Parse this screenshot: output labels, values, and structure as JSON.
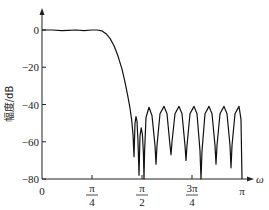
{
  "chart_data": {
    "type": "line",
    "title": "",
    "xlabel": "ω",
    "ylabel": "幅度/dB",
    "xlim": [
      0,
      3.14159
    ],
    "ylim": [
      -80,
      0
    ],
    "grid": false,
    "legend": null,
    "x_ticks": [
      {
        "value": 0,
        "label": "0"
      },
      {
        "value": 0.7854,
        "label_num": "π",
        "label_den": "4"
      },
      {
        "value": 1.5708,
        "label_num": "π",
        "label_den": "2"
      },
      {
        "value": 2.3562,
        "label_num": "3π",
        "label_den": "4"
      },
      {
        "value": 3.14159,
        "label": "π"
      }
    ],
    "y_ticks": [
      {
        "value": 0,
        "label": "0"
      },
      {
        "value": -20,
        "label": "−20"
      },
      {
        "value": -40,
        "label": "−40"
      },
      {
        "value": -60,
        "label": "−60"
      },
      {
        "value": -80,
        "label": "−80"
      }
    ],
    "series": [
      {
        "name": "magnitude response",
        "color": "#111111",
        "x_unit": "fraction_of_pi",
        "points": [
          [
            0.0,
            0.0
          ],
          [
            0.05,
            0.0
          ],
          [
            0.1,
            -0.3
          ],
          [
            0.13,
            -0.2
          ],
          [
            0.17,
            0.0
          ],
          [
            0.21,
            -0.3
          ],
          [
            0.25,
            0.0
          ],
          [
            0.275,
            0.0
          ],
          [
            0.3,
            -0.5
          ],
          [
            0.32,
            -2.0
          ],
          [
            0.34,
            -4.5
          ],
          [
            0.36,
            -8.5
          ],
          [
            0.38,
            -14.0
          ],
          [
            0.4,
            -21.0
          ],
          [
            0.415,
            -28.0
          ],
          [
            0.43,
            -36.0
          ],
          [
            0.44,
            -42.0
          ],
          [
            0.448,
            -48.0
          ],
          [
            0.455,
            -56.0
          ],
          [
            0.46,
            -68.0
          ],
          [
            0.465,
            -50.0
          ],
          [
            0.47,
            -46.5
          ],
          [
            0.475,
            -49.0
          ],
          [
            0.48,
            -60.0
          ],
          [
            0.485,
            -78.0
          ],
          [
            0.49,
            -57.0
          ],
          [
            0.496,
            -52.5
          ],
          [
            0.502,
            -56.0
          ],
          [
            0.507,
            -66.0
          ],
          [
            0.51,
            -80.0
          ],
          [
            0.513,
            -65.0
          ],
          [
            0.52,
            -47.0
          ],
          [
            0.535,
            -41.5
          ],
          [
            0.55,
            -46.0
          ],
          [
            0.565,
            -62.0
          ],
          [
            0.57,
            -72.0
          ],
          [
            0.575,
            -62.0
          ],
          [
            0.59,
            -45.0
          ],
          [
            0.61,
            -41.0
          ],
          [
            0.625,
            -45.0
          ],
          [
            0.64,
            -62.0
          ],
          [
            0.645,
            -67.0
          ],
          [
            0.65,
            -60.0
          ],
          [
            0.665,
            -45.0
          ],
          [
            0.685,
            -41.0
          ],
          [
            0.7,
            -45.0
          ],
          [
            0.715,
            -62.0
          ],
          [
            0.72,
            -70.0
          ],
          [
            0.725,
            -62.0
          ],
          [
            0.74,
            -45.0
          ],
          [
            0.76,
            -41.0
          ],
          [
            0.775,
            -45.0
          ],
          [
            0.79,
            -65.0
          ],
          [
            0.795,
            -80.0
          ],
          [
            0.8,
            -65.0
          ],
          [
            0.815,
            -45.0
          ],
          [
            0.835,
            -41.0
          ],
          [
            0.85,
            -45.0
          ],
          [
            0.865,
            -62.0
          ],
          [
            0.87,
            -72.0
          ],
          [
            0.875,
            -62.0
          ],
          [
            0.89,
            -45.0
          ],
          [
            0.91,
            -41.0
          ],
          [
            0.925,
            -45.0
          ],
          [
            0.94,
            -62.0
          ],
          [
            0.945,
            -74.0
          ],
          [
            0.95,
            -62.0
          ],
          [
            0.965,
            -45.0
          ],
          [
            0.985,
            -41.0
          ],
          [
            0.995,
            -48.0
          ],
          [
            1.0,
            -80.0
          ]
        ]
      }
    ],
    "annotations": []
  }
}
